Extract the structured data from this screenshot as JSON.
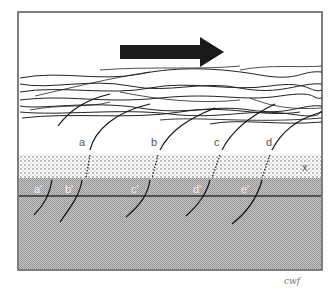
{
  "diagram": {
    "arrow_direction": "right",
    "arrow_color": "#1a1a1a",
    "layers": [
      {
        "name": "fiber-layer",
        "description": "tangled fibers"
      },
      {
        "name": "dotted-layer",
        "label": "x"
      },
      {
        "name": "gray-layer",
        "color": "#b8b8b8"
      }
    ],
    "upper_labels": [
      "a",
      "b",
      "c",
      "d"
    ],
    "lower_labels": [
      "a'",
      "b'",
      "c'",
      "d'",
      "e'"
    ],
    "layer_label": "x",
    "signature": "cwf"
  }
}
